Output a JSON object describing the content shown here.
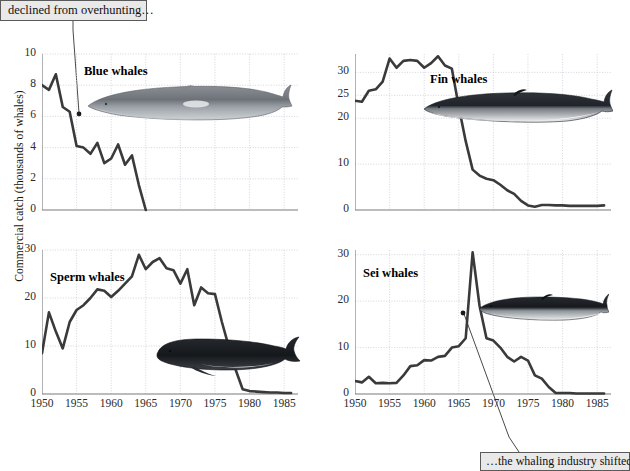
{
  "figure": {
    "ylabel": "Commercial catch (thousands of whales)",
    "callout_top": "declined from overhunting…",
    "callout_bottom": "…the whaling industry shifted",
    "line_color": "#3a3a3a",
    "grid_color": "#c9c9d6",
    "axis_color": "#7a7a7a",
    "background": "#ffffff"
  },
  "chart_data": [
    {
      "type": "line",
      "title": "Blue whales",
      "panel": "top-left",
      "xlabel": "",
      "ylabel": "Commercial catch (thousands of whales)",
      "xlim": [
        1950,
        1987
      ],
      "ylim": [
        0,
        10
      ],
      "yticks": [
        0,
        2,
        4,
        6,
        8,
        10
      ],
      "xticks": [
        1950,
        1955,
        1960,
        1965,
        1970,
        1975,
        1980,
        1985
      ],
      "grid": true,
      "x": [
        1950,
        1951,
        1952,
        1953,
        1954,
        1955,
        1956,
        1957,
        1958,
        1959,
        1960,
        1961,
        1962,
        1963,
        1964,
        1965
      ],
      "values": [
        8.0,
        7.7,
        8.7,
        6.6,
        6.3,
        4.1,
        4.0,
        3.6,
        4.3,
        3.0,
        3.3,
        4.2,
        2.9,
        3.5,
        1.6,
        0.0
      ]
    },
    {
      "type": "line",
      "title": "Fin whales",
      "panel": "top-right",
      "xlabel": "",
      "ylabel": "",
      "xlim": [
        1950,
        1987
      ],
      "ylim": [
        0,
        34
      ],
      "yticks": [
        0,
        10,
        20,
        25,
        30
      ],
      "xticks": [
        1950,
        1955,
        1960,
        1965,
        1970,
        1975,
        1980,
        1985
      ],
      "grid": true,
      "x": [
        1950,
        1951,
        1952,
        1953,
        1954,
        1955,
        1956,
        1957,
        1958,
        1959,
        1960,
        1961,
        1962,
        1963,
        1964,
        1965,
        1966,
        1967,
        1968,
        1969,
        1970,
        1971,
        1972,
        1973,
        1974,
        1975,
        1976,
        1977,
        1978,
        1979,
        1980,
        1981,
        1982,
        1983,
        1984,
        1985,
        1986
      ],
      "values": [
        23.8,
        23.6,
        26.0,
        26.3,
        28.0,
        33.0,
        31.0,
        32.5,
        32.7,
        32.5,
        31.0,
        32.0,
        33.5,
        31.5,
        30.8,
        22.5,
        15.0,
        8.8,
        7.5,
        6.8,
        6.5,
        5.5,
        4.3,
        3.5,
        2.0,
        1.0,
        0.7,
        1.1,
        1.1,
        1.0,
        1.0,
        0.9,
        0.9,
        0.9,
        0.9,
        0.9,
        1.0
      ]
    },
    {
      "type": "line",
      "title": "Sperm whales",
      "panel": "bottom-left",
      "xlabel": "",
      "ylabel": "Commercial catch (thousands of whales)",
      "xlim": [
        1950,
        1987
      ],
      "ylim": [
        0,
        30
      ],
      "yticks": [
        0,
        10,
        20,
        30
      ],
      "xticks": [
        1950,
        1955,
        1960,
        1965,
        1970,
        1975,
        1980,
        1985
      ],
      "grid": true,
      "x": [
        1950,
        1951,
        1952,
        1953,
        1954,
        1955,
        1956,
        1957,
        1958,
        1959,
        1960,
        1961,
        1962,
        1963,
        1964,
        1965,
        1966,
        1967,
        1968,
        1969,
        1970,
        1971,
        1972,
        1973,
        1974,
        1975,
        1976,
        1977,
        1978,
        1979,
        1980,
        1981,
        1982,
        1983,
        1984,
        1985,
        1986
      ],
      "values": [
        8.5,
        17.0,
        13.0,
        9.5,
        15.0,
        17.5,
        18.5,
        20.0,
        21.8,
        21.5,
        20.2,
        21.5,
        23.0,
        24.5,
        29.0,
        26.0,
        27.5,
        28.3,
        26.2,
        25.8,
        23.0,
        26.0,
        18.5,
        22.2,
        21.0,
        20.8,
        15.0,
        9.8,
        5.0,
        1.0,
        0.6,
        0.5,
        0.4,
        0.3,
        0.3,
        0.2,
        0.2
      ]
    },
    {
      "type": "line",
      "title": "Sei whales",
      "panel": "bottom-right",
      "xlabel": "",
      "ylabel": "",
      "xlim": [
        1950,
        1987
      ],
      "ylim": [
        0,
        31
      ],
      "yticks": [
        0,
        10,
        20,
        30
      ],
      "xticks": [
        1950,
        1955,
        1960,
        1965,
        1970,
        1975,
        1980,
        1985
      ],
      "grid": true,
      "x": [
        1950,
        1951,
        1952,
        1953,
        1954,
        1955,
        1956,
        1957,
        1958,
        1959,
        1960,
        1961,
        1962,
        1963,
        1964,
        1965,
        1966,
        1967,
        1968,
        1969,
        1970,
        1971,
        1972,
        1973,
        1974,
        1975,
        1976,
        1977,
        1978,
        1979,
        1980,
        1981,
        1982,
        1983,
        1984,
        1985,
        1986
      ],
      "values": [
        2.8,
        2.5,
        3.7,
        2.3,
        2.4,
        2.3,
        2.4,
        4.0,
        6.0,
        6.2,
        7.3,
        7.2,
        8.0,
        8.2,
        10.0,
        10.3,
        12.0,
        30.5,
        19.0,
        12.0,
        11.5,
        10.0,
        8.0,
        7.0,
        8.0,
        7.2,
        4.0,
        3.3,
        1.5,
        0.2,
        0.2,
        0.2,
        0.1,
        0.1,
        0.1,
        0.1,
        0.1
      ]
    }
  ],
  "annotations": [
    {
      "name": "blue-whales-pointer",
      "text": "declined from overhunting…",
      "target_year": 1953,
      "target_value": 6.6
    },
    {
      "name": "sei-whales-pointer",
      "text": "…the whaling industry shifted",
      "target_year": 1967,
      "target_value": 16.5
    }
  ]
}
